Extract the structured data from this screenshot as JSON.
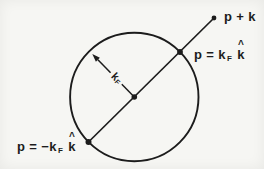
{
  "colors": {
    "background": "#f6f6f3",
    "ink": "#1c1c1c"
  },
  "labels": {
    "p_plus_k": "p + k",
    "p_eq_kf": {
      "prefix": "p = k",
      "sub": "F",
      "khat": "k",
      "hat": "^"
    },
    "p_eq_neg_kf": {
      "prefix": "p = −k",
      "sub": "F",
      "khat": "k",
      "hat": "^"
    },
    "kf_radius": {
      "main": "k",
      "sub": "F"
    }
  }
}
